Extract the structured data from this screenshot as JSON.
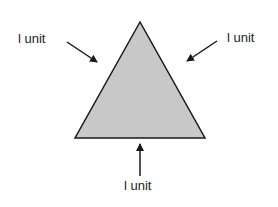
{
  "diagram": {
    "shape": "equilateral-triangle",
    "fill_color": "#c8c8c8",
    "stroke_color": "#1a1a1a",
    "labels": {
      "left": "l unit",
      "right": "l unit",
      "bottom": "l unit"
    }
  }
}
